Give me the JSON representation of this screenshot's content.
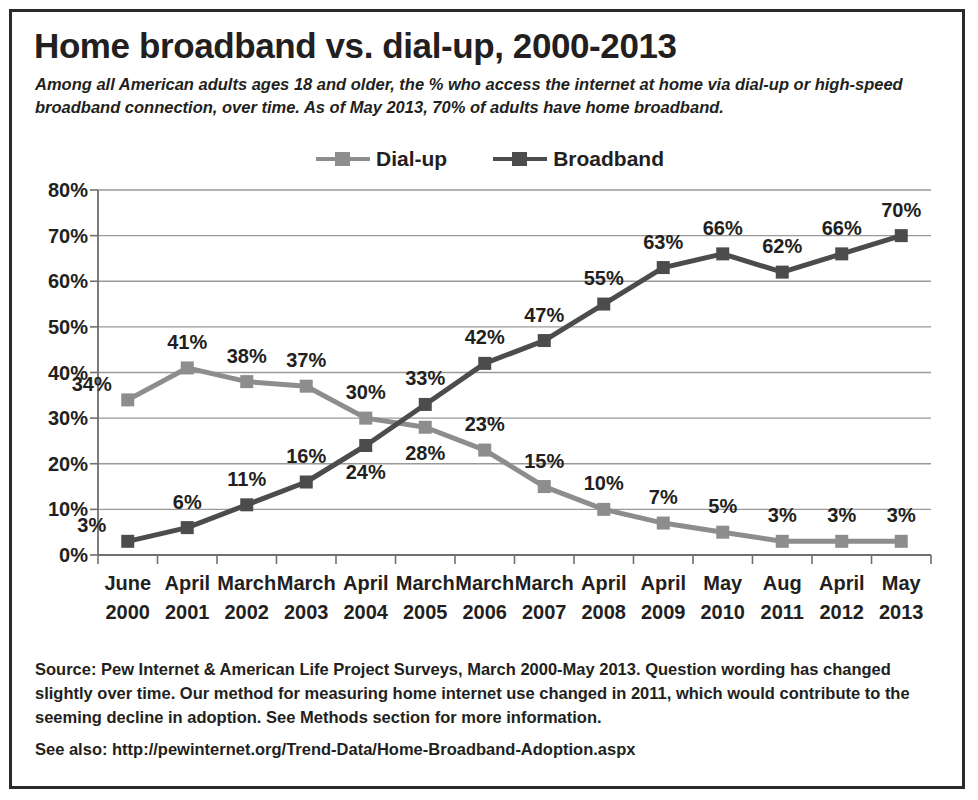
{
  "title": "Home broadband vs. dial-up, 2000-2013",
  "subtitle": "Among all American adults ages 18 and older, the % who access the internet at home via dial-up or high-speed broadband connection, over time. As of May 2013, 70% of adults have home broadband.",
  "source": "Source: Pew Internet & American Life Project Surveys, March 2000-May 2013. Question wording has changed slightly over time. Our method for measuring home internet use changed in 2011, which would contribute to the seeming decline in adoption. See Methods section for more information.",
  "see_also": "See also: http://pewinternet.org/Trend-Data/Home-Broadband-Adoption.aspx",
  "colors": {
    "dialup": "#8d8d8d",
    "broadband": "#4c4c4c",
    "grid": "#9a9a9a",
    "axis": "#6f6f6f",
    "border": "#2a2a2a",
    "text": "#231f20"
  },
  "chart_data": {
    "type": "line",
    "title": "Home broadband vs. dial-up, 2000-2013",
    "xlabel": "",
    "ylabel": "",
    "ylim": [
      0,
      80
    ],
    "ytick_labels": [
      "0%",
      "10%",
      "20%",
      "30%",
      "40%",
      "50%",
      "60%",
      "70%",
      "80%"
    ],
    "yticks": [
      0,
      10,
      20,
      30,
      40,
      50,
      60,
      70,
      80
    ],
    "grid": true,
    "legend_position": "top-center",
    "categories": [
      "June 2000",
      "April 2001",
      "March 2002",
      "March 2003",
      "April 2004",
      "March 2005",
      "March 2006",
      "March 2007",
      "April 2008",
      "April 2009",
      "May 2010",
      "Aug 2011",
      "April 2012",
      "May 2013"
    ],
    "category_lines": [
      [
        "June",
        "2000"
      ],
      [
        "April",
        "2001"
      ],
      [
        "March",
        "2002"
      ],
      [
        "March",
        "2003"
      ],
      [
        "April",
        "2004"
      ],
      [
        "March",
        "2005"
      ],
      [
        "March",
        "2006"
      ],
      [
        "March",
        "2007"
      ],
      [
        "April",
        "2008"
      ],
      [
        "April",
        "2009"
      ],
      [
        "May",
        "2010"
      ],
      [
        "Aug",
        "2011"
      ],
      [
        "April",
        "2012"
      ],
      [
        "May",
        "2013"
      ]
    ],
    "series": [
      {
        "name": "Dial-up",
        "color": "#8d8d8d",
        "values": [
          34,
          41,
          38,
          37,
          30,
          28,
          23,
          15,
          10,
          7,
          5,
          3,
          3,
          3
        ],
        "labels": [
          "34%",
          "41%",
          "38%",
          "37%",
          "30%",
          "28%",
          "23%",
          "15%",
          "10%",
          "7%",
          "5%",
          "3%",
          "3%",
          "3%"
        ],
        "label_side": [
          "left",
          "above",
          "above",
          "above",
          "above",
          "below",
          "above",
          "above",
          "above",
          "above",
          "above",
          "above",
          "above",
          "above"
        ]
      },
      {
        "name": "Broadband",
        "color": "#4c4c4c",
        "values": [
          3,
          6,
          11,
          16,
          24,
          33,
          42,
          47,
          55,
          63,
          66,
          62,
          66,
          70
        ],
        "labels": [
          "3%",
          "6%",
          "11%",
          "16%",
          "24%",
          "33%",
          "42%",
          "47%",
          "55%",
          "63%",
          "66%",
          "62%",
          "66%",
          "70%"
        ],
        "label_side": [
          "left",
          "above",
          "above",
          "above",
          "below",
          "above",
          "above",
          "above",
          "above",
          "above",
          "above",
          "above",
          "above",
          "above"
        ]
      }
    ]
  }
}
